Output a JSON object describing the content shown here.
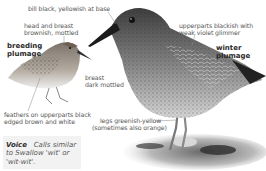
{
  "illustration": {
    "subject": "sandpiper",
    "views": [
      {
        "id": "breeding",
        "label": "breeding\nplumage"
      },
      {
        "id": "winter",
        "label": "winter\nplumage"
      }
    ]
  },
  "annotations": {
    "bill": "bill black, yellowish at base",
    "head_breast_line1": "head and breast",
    "head_breast_line2": "brownish, mottled",
    "upperparts_line1": "upperparts blackish with",
    "upperparts_line2": "weak violet glimmer",
    "breast_line1": "breast",
    "breast_line2": "dark mottled",
    "feathers_line1": "feathers on upperparts black",
    "feathers_line2": "edged brown and white",
    "legs_line1": "legs greenish-yellow",
    "legs_line2": "(sometimes also orange)"
  },
  "plumage_labels": {
    "breeding_line1": "breeding",
    "breeding_line2": "plumage",
    "winter_line1": "winter",
    "winter_line2": "plumage"
  },
  "voice": {
    "heading": "Voice",
    "text_line1": "Calls similar",
    "text_line2": "to Swallow 'wit' or",
    "text_line3": "'wit-wit'."
  },
  "colors": {
    "background": "#ffffff",
    "text": "#555555",
    "heading": "#2a2a2a",
    "voice_box": "#f2f2f2"
  }
}
